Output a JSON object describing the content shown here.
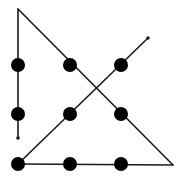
{
  "diagram": {
    "width": 182,
    "height": 183,
    "background": "#ffffff",
    "line_color": "#1a1a1a",
    "dot_color": "#000000",
    "dot_radius": 7,
    "line_width": 1.6,
    "dots": [
      {
        "row": 0,
        "col": 0,
        "x": 18,
        "y": 65
      },
      {
        "row": 0,
        "col": 1,
        "x": 70,
        "y": 65
      },
      {
        "row": 0,
        "col": 2,
        "x": 121,
        "y": 65
      },
      {
        "row": 1,
        "col": 0,
        "x": 18,
        "y": 114
      },
      {
        "row": 1,
        "col": 1,
        "x": 70,
        "y": 114
      },
      {
        "row": 1,
        "col": 2,
        "x": 121,
        "y": 114
      },
      {
        "row": 2,
        "col": 0,
        "x": 18,
        "y": 164
      },
      {
        "row": 2,
        "col": 1,
        "x": 70,
        "y": 164
      },
      {
        "row": 2,
        "col": 2,
        "x": 121,
        "y": 164
      }
    ],
    "path": [
      {
        "x": 18,
        "y": 138
      },
      {
        "x": 18,
        "y": 9
      },
      {
        "x": 173,
        "y": 165
      },
      {
        "x": 18,
        "y": 164
      },
      {
        "x": 148,
        "y": 38
      }
    ],
    "endpoints": [
      {
        "name": "path-start",
        "x": 18,
        "y": 138
      },
      {
        "name": "path-end",
        "x": 148,
        "y": 38
      }
    ]
  }
}
